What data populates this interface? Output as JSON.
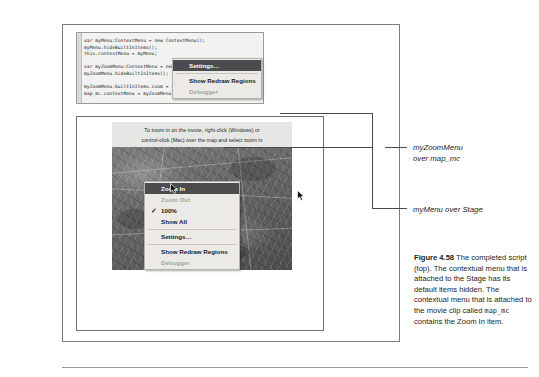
{
  "code": {
    "lines": [
      "var myMenu:ContextMenu = new ContextMenu();",
      "myMenu.hideBuiltInItems();",
      "this.contextMenu = myMenu;",
      "",
      "var myZoomMenu:ContextMenu = new ContextMenu();",
      "myZoomMenu.hideBuiltInItems();",
      "",
      "myZoomMenu.builtInItems.zoom = true;",
      "map_mc.contextMenu = myZoomMenu;"
    ]
  },
  "movie": {
    "instruction_line1": "To zoom in on the movie, right-click (Windows) or",
    "instruction_line2": "control-click (Mac) over the map and select zoom in"
  },
  "zoom_menu": {
    "name": "myZoomMenu",
    "items": [
      {
        "label": "Zoom In",
        "state": "selected",
        "check": ""
      },
      {
        "label": "Zoom Out",
        "state": "disabled",
        "check": ""
      },
      {
        "label": "100%",
        "state": "normal",
        "check": "✓"
      },
      {
        "label": "Show All",
        "state": "normal",
        "check": ""
      },
      {
        "label": "Settings…",
        "state": "normal",
        "check": ""
      },
      {
        "label": "Show Redraw Regions",
        "state": "normal",
        "check": ""
      },
      {
        "label": "Debugger",
        "state": "disabled",
        "check": ""
      }
    ]
  },
  "stage_menu": {
    "name": "myMenu",
    "items": [
      {
        "label": "Settings…",
        "state": "selected",
        "check": ""
      },
      {
        "label": "Show Redraw Regions",
        "state": "normal",
        "check": ""
      },
      {
        "label": "Debugger",
        "state": "disabled",
        "check": ""
      }
    ]
  },
  "annotations": {
    "zoom_line1": "myZoomMenu",
    "zoom_line2": "over map_mc",
    "stage": "myMenu over Stage"
  },
  "caption": {
    "figure_number": "Figure 4.58",
    "text_part1": " The completed script (top). The contextual menu that is attached to the Stage has its default items hidden. The contextual menu that is attached to the ",
    "text_part2": "movie clip called ",
    "mono_term": "map_mc",
    "text_part3": " contains the Zoom In item."
  },
  "colors": {
    "menu_background": "#eceae6",
    "menu_highlight": "#4c4c4e",
    "disabled_text": "#a3a3a1",
    "frame_border": "#7c7c7c",
    "caption_bar": "#e6e6e4"
  }
}
